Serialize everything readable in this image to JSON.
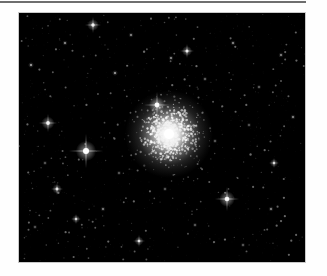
{
  "page": {
    "background_color": "#fefefe",
    "width": 327,
    "height": 276
  },
  "top_rule": {
    "name": "horizontal-rule",
    "color": "#6e6e6e",
    "x": 0,
    "y": 1,
    "width": 306,
    "height": 2
  },
  "plate": {
    "title": "",
    "border_color": "#c9c9c9",
    "background_color": "#000000",
    "x": 18,
    "y": 12,
    "width": 288,
    "height": 251
  },
  "astro_image": {
    "subject": "globular star cluster",
    "field_background_color": "#000000",
    "star_color": "#ffffff",
    "cluster": {
      "name": "globular-cluster",
      "center_x": 150,
      "center_y": 121,
      "core_radius": 9,
      "halo_radius": 44,
      "core_color": "#ffffff",
      "halo_color": "#d8d8d8",
      "member_star_count": 520,
      "member_star_spread": 40
    },
    "bright_stars": [
      {
        "name": "bright-star-left",
        "x": 67,
        "y": 138,
        "radius": 3.0,
        "spike": 17,
        "brightness": 1.0
      },
      {
        "name": "bright-star-above-cluster",
        "x": 138,
        "y": 92,
        "radius": 2.4,
        "spike": 13,
        "brightness": 0.95
      },
      {
        "name": "bright-star-lower-right",
        "x": 208,
        "y": 186,
        "radius": 2.3,
        "spike": 12,
        "brightness": 0.92
      },
      {
        "name": "bright-star-upper-left",
        "x": 29,
        "y": 110,
        "radius": 1.9,
        "spike": 9,
        "brightness": 0.85
      },
      {
        "name": "bright-star-top",
        "x": 74,
        "y": 12,
        "radius": 1.7,
        "spike": 8,
        "brightness": 0.82
      },
      {
        "name": "bright-star-top-middle",
        "x": 168,
        "y": 38,
        "radius": 1.5,
        "spike": 7,
        "brightness": 0.78
      },
      {
        "name": "bright-star-mid-left",
        "x": 38,
        "y": 176,
        "radius": 1.4,
        "spike": 6,
        "brightness": 0.74
      },
      {
        "name": "bright-star-lower-mid",
        "x": 120,
        "y": 228,
        "radius": 1.3,
        "spike": 6,
        "brightness": 0.7
      },
      {
        "name": "bright-star-right-edge",
        "x": 255,
        "y": 150,
        "radius": 1.2,
        "spike": 5,
        "brightness": 0.66
      },
      {
        "name": "bright-star-lower-left",
        "x": 57,
        "y": 206,
        "radius": 1.2,
        "spike": 5,
        "brightness": 0.64
      }
    ],
    "medium_stars": [
      {
        "x": 12,
        "y": 52,
        "r": 1.0,
        "b": 0.6
      },
      {
        "x": 46,
        "y": 30,
        "r": 0.9,
        "b": 0.55
      },
      {
        "x": 96,
        "y": 60,
        "r": 1.0,
        "b": 0.58
      },
      {
        "x": 112,
        "y": 22,
        "r": 0.9,
        "b": 0.52
      },
      {
        "x": 152,
        "y": 45,
        "r": 0.9,
        "b": 0.54
      },
      {
        "x": 186,
        "y": 66,
        "r": 0.8,
        "b": 0.5
      },
      {
        "x": 214,
        "y": 30,
        "r": 0.9,
        "b": 0.53
      },
      {
        "x": 240,
        "y": 74,
        "r": 0.8,
        "b": 0.48
      },
      {
        "x": 262,
        "y": 42,
        "r": 0.9,
        "b": 0.5
      },
      {
        "x": 274,
        "y": 104,
        "r": 0.9,
        "b": 0.52
      },
      {
        "x": 252,
        "y": 196,
        "r": 0.9,
        "b": 0.5
      },
      {
        "x": 224,
        "y": 232,
        "r": 0.8,
        "b": 0.46
      },
      {
        "x": 176,
        "y": 212,
        "r": 0.8,
        "b": 0.47
      },
      {
        "x": 146,
        "y": 176,
        "r": 0.8,
        "b": 0.45
      },
      {
        "x": 100,
        "y": 160,
        "r": 0.8,
        "b": 0.46
      },
      {
        "x": 84,
        "y": 196,
        "r": 0.9,
        "b": 0.49
      },
      {
        "x": 26,
        "y": 150,
        "r": 0.8,
        "b": 0.45
      },
      {
        "x": 16,
        "y": 214,
        "r": 0.8,
        "b": 0.44
      },
      {
        "x": 196,
        "y": 128,
        "r": 0.8,
        "b": 0.46
      },
      {
        "x": 230,
        "y": 112,
        "r": 0.8,
        "b": 0.44
      }
    ],
    "faint_field_star_count": 900,
    "faint_star_min_brightness": 0.06,
    "faint_star_max_brightness": 0.42
  }
}
